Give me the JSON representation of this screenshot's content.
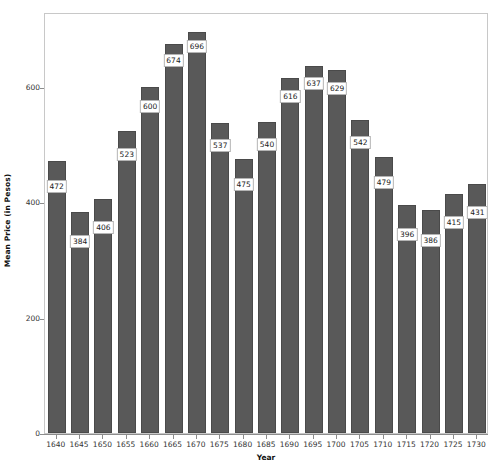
{
  "chart_data": {
    "type": "bar",
    "title": "",
    "xlabel": "Year",
    "ylabel": "Mean Price (in Pesos)",
    "categories": [
      "1640",
      "1645",
      "1650",
      "1655",
      "1660",
      "1665",
      "1670",
      "1675",
      "1680",
      "1685",
      "1690",
      "1695",
      "1700",
      "1705",
      "1710",
      "1715",
      "1720",
      "1725",
      "1730"
    ],
    "values": [
      472,
      384,
      406,
      523,
      600,
      674,
      696,
      537,
      475,
      540,
      616,
      637,
      629,
      542,
      479,
      396,
      386,
      415,
      431
    ],
    "data_labels": [
      "472",
      "384",
      "406",
      "523",
      "600",
      "674",
      "696",
      "537",
      "475",
      "540",
      "616",
      "637",
      "629",
      "542",
      "479",
      "396",
      "386",
      "415",
      "431"
    ],
    "ylim": [
      0,
      730
    ],
    "y_ticks": [
      0,
      200,
      400,
      600
    ],
    "y_tick_labels": [
      "0",
      "200",
      "400",
      "600"
    ],
    "grid": false,
    "legend": false,
    "legend_position": "none",
    "bar_color": "#595959",
    "bar_edge_color": "#4a4a4a",
    "label_box_fill": "#ffffff",
    "label_box_border": "#b4b4b4",
    "frame_color": "#c8c8c8",
    "axis_color": "#8c8c8c",
    "background": "#ffffff"
  }
}
